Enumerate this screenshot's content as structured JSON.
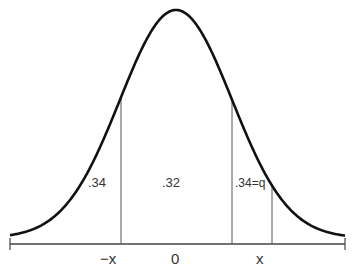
{
  "diagram": {
    "type": "normal-distribution-areas",
    "mean": 0,
    "cutoff": "x",
    "regions": [
      {
        "name": "left-tail-region",
        "label": ".34"
      },
      {
        "name": "center-region",
        "label": ".32"
      },
      {
        "name": "right-region",
        "label": ".34=q"
      }
    ],
    "axis_labels": {
      "neg_x": "−x",
      "zero": "0",
      "pos_x": "x"
    },
    "colors": {
      "curve": "#111111",
      "lines": "#555555"
    }
  }
}
